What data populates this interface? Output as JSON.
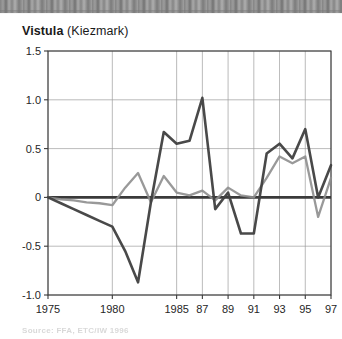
{
  "chart_title": {
    "main": "Vistula",
    "sub": " (Kiezmark)"
  },
  "source_note": "Source: FFA, ETC/IW 1996",
  "colors": {
    "series_dark": "#3f3f3f",
    "series_gray": "#8e8e8e",
    "grid": "#9a9a9a",
    "axis": "#3a3a3a",
    "zero_line": "#3a3a3a",
    "text": "#262626",
    "background": "#ffffff"
  },
  "chart_data": {
    "type": "line",
    "title": "Vistula (Kiezmark)",
    "xlabel": "",
    "ylabel": "",
    "xlim": [
      1975,
      1997
    ],
    "ylim": [
      -1.0,
      1.5
    ],
    "yticks": [
      -1.0,
      -0.5,
      0,
      0.5,
      1.0,
      1.5
    ],
    "ytick_labels": [
      "-1.0",
      "-0.5",
      "0",
      "0.5",
      "1.0",
      "1.5"
    ],
    "xticks": [
      1975,
      1980,
      1985,
      1987,
      1989,
      1991,
      1993,
      1995,
      1997
    ],
    "xtick_labels": [
      "1975",
      "1980",
      "1985",
      "87",
      "89",
      "91",
      "93",
      "95",
      "97"
    ],
    "grid": true,
    "legend": "none",
    "zero_line": true,
    "x": [
      1975,
      1976,
      1977,
      1978,
      1979,
      1980,
      1981,
      1982,
      1983,
      1984,
      1985,
      1986,
      1987,
      1988,
      1989,
      1990,
      1991,
      1992,
      1993,
      1994,
      1995,
      1996,
      1997
    ],
    "series": [
      {
        "name": "series-dark",
        "color": "#3f3f3f",
        "values": [
          0.0,
          -0.06,
          -0.12,
          -0.18,
          -0.24,
          -0.3,
          -0.55,
          -0.87,
          -0.05,
          0.67,
          0.55,
          0.58,
          1.02,
          -0.12,
          0.05,
          -0.37,
          -0.37,
          0.45,
          0.55,
          0.4,
          0.7,
          0.0,
          0.33
        ]
      },
      {
        "name": "series-gray",
        "color": "#8e8e8e",
        "values": [
          0.0,
          -0.02,
          -0.03,
          -0.05,
          -0.06,
          -0.08,
          0.1,
          0.25,
          -0.05,
          0.22,
          0.05,
          0.02,
          0.07,
          -0.03,
          0.1,
          0.02,
          0.0,
          0.2,
          0.42,
          0.35,
          0.42,
          -0.2,
          0.2
        ]
      }
    ]
  }
}
